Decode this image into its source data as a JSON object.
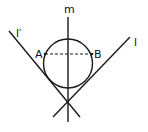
{
  "diagram": {
    "labels": {
      "m": "m",
      "l_prime": "l′",
      "l": "l",
      "A": "A",
      "B": "B"
    },
    "circle": {
      "cx": 68,
      "cy": 63.5,
      "r": 24.5
    },
    "lines": {
      "m": {
        "x1": 68,
        "y1": 17,
        "x2": 68,
        "y2": 122
      },
      "l_prime": {
        "x1": 9,
        "y1": 31,
        "x2": 80,
        "y2": 117
      },
      "l": {
        "x1": 130,
        "y1": 37,
        "x2": 53,
        "y2": 117
      },
      "AB": {
        "x1": 45,
        "y1": 54,
        "x2": 92,
        "y2": 54
      }
    },
    "points": {
      "A": {
        "x": 45,
        "y": 54
      },
      "B": {
        "x": 92,
        "y": 54
      },
      "vertex": {
        "x": 67,
        "y": 101
      }
    },
    "colors": {
      "stroke": "#1a1a1a",
      "background": "#ffffff"
    }
  }
}
